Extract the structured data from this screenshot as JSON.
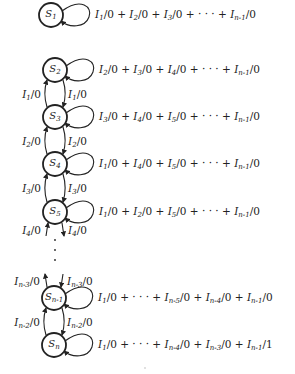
{
  "diagram": {
    "type": "state-transition-diagram",
    "states": [
      {
        "id": "S1",
        "name": "S",
        "sub": "1",
        "cx": 51,
        "cy": 15,
        "self_loop": [
          [
            "I",
            "1",
            "0"
          ],
          [
            "I",
            "2",
            "0"
          ],
          [
            "I",
            "3",
            "0"
          ],
          [
            "dots"
          ],
          [
            "I",
            "n-1",
            "0"
          ]
        ]
      },
      {
        "id": "S2",
        "name": "S",
        "sub": "2",
        "cx": 55,
        "cy": 70,
        "self_loop": [
          [
            "I",
            "2",
            "0"
          ],
          [
            "I",
            "3",
            "0"
          ],
          [
            "I",
            "4",
            "0"
          ],
          [
            "dots"
          ],
          [
            "I",
            "n-1",
            "0"
          ]
        ]
      },
      {
        "id": "S3",
        "name": "S",
        "sub": "3",
        "cx": 55,
        "cy": 117,
        "self_loop": [
          [
            "I",
            "3",
            "0"
          ],
          [
            "I",
            "4",
            "0"
          ],
          [
            "I",
            "5",
            "0"
          ],
          [
            "dots"
          ],
          [
            "I",
            "n-1",
            "0"
          ]
        ]
      },
      {
        "id": "S4",
        "name": "S",
        "sub": "4",
        "cx": 55,
        "cy": 164,
        "self_loop": [
          [
            "I",
            "1",
            "0"
          ],
          [
            "I",
            "4",
            "0"
          ],
          [
            "I",
            "5",
            "0"
          ],
          [
            "dots"
          ],
          [
            "I",
            "n-1",
            "0"
          ]
        ]
      },
      {
        "id": "S5",
        "name": "S",
        "sub": "5",
        "cx": 55,
        "cy": 212,
        "self_loop": [
          [
            "I",
            "1",
            "0"
          ],
          [
            "I",
            "2",
            "0"
          ],
          [
            "I",
            "5",
            "0"
          ],
          [
            "dots"
          ],
          [
            "I",
            "n-1",
            "0"
          ]
        ]
      },
      {
        "id": "Sn-1",
        "name": "S",
        "sub": "n-1",
        "cx": 54,
        "cy": 298,
        "self_loop": [
          [
            "I",
            "1",
            "0"
          ],
          [
            "dots"
          ],
          [
            "I",
            "n-5",
            "0"
          ],
          [
            "I",
            "n-4",
            "0"
          ],
          [
            "I",
            "n-1",
            "0"
          ]
        ]
      },
      {
        "id": "Sn",
        "name": "S",
        "sub": "n",
        "cx": 54,
        "cy": 345,
        "self_loop": [
          [
            "I",
            "1",
            "0"
          ],
          [
            "dots"
          ],
          [
            "I",
            "n-4",
            "0"
          ],
          [
            "I",
            "n-3",
            "0"
          ],
          [
            "I",
            "n-1",
            "1"
          ]
        ]
      }
    ],
    "transitions": [
      {
        "from": "S3",
        "to": "S2",
        "side": "left",
        "label": {
          "I": "I",
          "sub": "1",
          "out": "0"
        }
      },
      {
        "from": "S2",
        "to": "S3",
        "side": "right",
        "label": {
          "I": "I",
          "sub": "1",
          "out": "0"
        }
      },
      {
        "from": "S4",
        "to": "S3",
        "side": "left",
        "label": {
          "I": "I",
          "sub": "2",
          "out": "0"
        }
      },
      {
        "from": "S3",
        "to": "S4",
        "side": "right",
        "label": {
          "I": "I",
          "sub": "2",
          "out": "0"
        }
      },
      {
        "from": "S5",
        "to": "S4",
        "side": "left",
        "label": {
          "I": "I",
          "sub": "3",
          "out": "0"
        }
      },
      {
        "from": "S4",
        "to": "S5",
        "side": "right",
        "label": {
          "I": "I",
          "sub": "3",
          "out": "0"
        }
      },
      {
        "from": "…",
        "to": "S5",
        "side": "left",
        "label": {
          "I": "I",
          "sub": "4",
          "out": "0"
        }
      },
      {
        "from": "S5",
        "to": "…",
        "side": "right",
        "label": {
          "I": "I",
          "sub": "4",
          "out": "0"
        }
      },
      {
        "from": "Sn-1",
        "to": "…",
        "side": "left",
        "label": {
          "I": "I",
          "sub": "n-3",
          "out": "0"
        }
      },
      {
        "from": "…",
        "to": "Sn-1",
        "side": "right",
        "label": {
          "I": "I",
          "sub": "n-3",
          "out": "0"
        }
      },
      {
        "from": "Sn",
        "to": "Sn-1",
        "side": "left",
        "label": {
          "I": "I",
          "sub": "n-2",
          "out": "0"
        }
      },
      {
        "from": "Sn-1",
        "to": "Sn",
        "side": "right",
        "label": {
          "I": "I",
          "sub": "n-2",
          "out": "0"
        }
      }
    ],
    "ellipsis": "⋮",
    "colors": {
      "ink": "#222222",
      "background": "#ffffff"
    }
  }
}
